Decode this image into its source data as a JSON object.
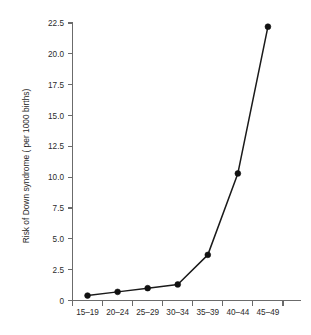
{
  "chart_data": {
    "type": "line",
    "title": "",
    "xlabel": "",
    "ylabel": "Risk of Down syndrome ( per 1000 births)",
    "categories": [
      "15–19",
      "20–24",
      "25–29",
      "30–34",
      "35–39",
      "40–44",
      "45–49"
    ],
    "values": [
      0.4,
      0.7,
      1.0,
      1.3,
      3.7,
      10.3,
      22.2
    ],
    "ylim": [
      0,
      22.5
    ],
    "yticks": [
      0,
      2.5,
      5.0,
      7.5,
      10.0,
      12.5,
      15.0,
      17.5,
      20.0,
      22.5
    ],
    "ytick_labels": [
      "0",
      "2.5",
      "5.0",
      "7.5",
      "10.0",
      "12.5",
      "15.0",
      "17.5",
      "20.0",
      "22.5"
    ],
    "grid": false,
    "legend": null,
    "series_color": "#1a1a1a",
    "axis_color": "#6b6b6b",
    "background": "#ffffff",
    "marker": "circle",
    "annotations": []
  }
}
